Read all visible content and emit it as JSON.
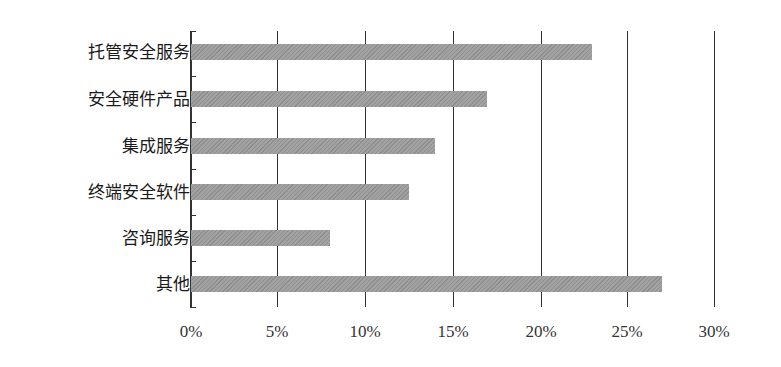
{
  "chart_data": {
    "type": "bar",
    "orientation": "horizontal",
    "title": "",
    "xlabel": "",
    "ylabel": "",
    "categories": [
      "托管安全服务",
      "安全硬件产品",
      "集成服务",
      "终端安全软件",
      "咨询服务",
      "其他"
    ],
    "values": [
      23,
      17,
      14,
      12.5,
      8,
      27
    ],
    "unit": "%",
    "xlim": [
      0,
      30
    ],
    "x_ticks": [
      "0%",
      "5%",
      "10%",
      "15%",
      "20%",
      "25%",
      "30%"
    ],
    "grid": "vertical",
    "legend": null,
    "bar_color": "#999999"
  },
  "labels": {
    "cat0": "托管安全服务",
    "cat1": "安全硬件产品",
    "cat2": "集成服务",
    "cat3": "终端安全软件",
    "cat4": "咨询服务",
    "cat5": "其他",
    "t0": "0%",
    "t1": "5%",
    "t2": "10%",
    "t3": "15%",
    "t4": "20%",
    "t5": "25%",
    "t6": "30%"
  }
}
